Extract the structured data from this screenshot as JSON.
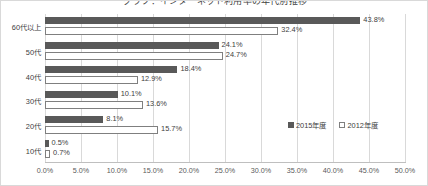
{
  "chart_data": {
    "type": "bar",
    "orientation": "horizontal",
    "title": "グラフ：インターネット利用率の年代別推移",
    "xlabel": "",
    "ylabel": "",
    "xlim": [
      0,
      50
    ],
    "xtick_step": 5,
    "xticks": [
      "0.0%",
      "5.0%",
      "10.0%",
      "15.0%",
      "20.0%",
      "25.0%",
      "30.0%",
      "35.0%",
      "40.0%",
      "45.0%",
      "50.0%"
    ],
    "categories": [
      "60代以上",
      "50代",
      "40代",
      "30代",
      "20代",
      "10代"
    ],
    "grid": true,
    "legend_position": "inside-right",
    "series": [
      {
        "name": "2015年度",
        "color": "#595959",
        "style": "filled",
        "values": [
          43.8,
          24.1,
          18.4,
          10.1,
          8.1,
          0.5
        ],
        "labels": [
          "43.8%",
          "24.1%",
          "18.4%",
          "10.1%",
          "8.1%",
          "0.5%"
        ]
      },
      {
        "name": "2012年度",
        "color": "#ffffff",
        "style": "hollow",
        "values": [
          32.4,
          24.7,
          12.9,
          13.6,
          15.7,
          0.7
        ],
        "labels": [
          "32.4%",
          "24.7%",
          "12.9%",
          "13.6%",
          "15.7%",
          "0.7%"
        ]
      }
    ]
  },
  "colors": {
    "series_2015": "#595959",
    "series_2012_outline": "#7f7f7f",
    "gridline": "#d9d9d9",
    "axis": "#bfbfbf",
    "text": "#404040",
    "border": "#d9d9d9",
    "background": "#ffffff"
  }
}
